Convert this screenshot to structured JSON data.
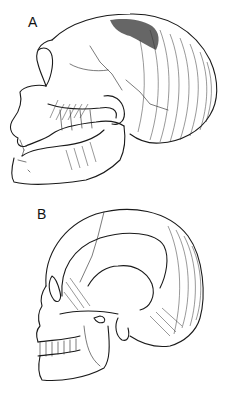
{
  "figure": {
    "panels": [
      {
        "id": "A",
        "label": "A",
        "description": "Lateral view of an archaic (Neanderthal-type) skull with low, elongated vault, prominent brow ridge and protruding face"
      },
      {
        "id": "B",
        "label": "B",
        "description": "Lateral view of a modern human skull with high, rounded vault and flat face"
      }
    ],
    "colors": {
      "ink": "#1a1a1a",
      "background": "#ffffff"
    }
  }
}
